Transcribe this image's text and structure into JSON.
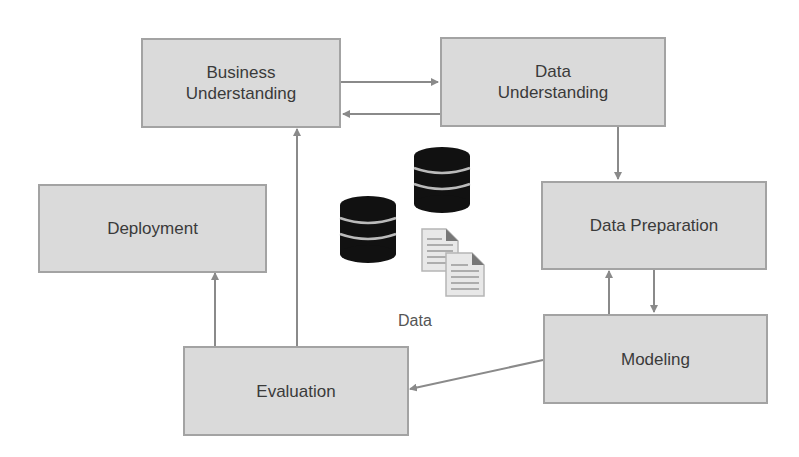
{
  "diagram": {
    "nodes": [
      {
        "id": "business",
        "label_line1": "Business",
        "label_line2": "Understanding"
      },
      {
        "id": "data_understanding",
        "label_line1": "Data",
        "label_line2": "Understanding"
      },
      {
        "id": "data_preparation",
        "label": "Data Preparation"
      },
      {
        "id": "modeling",
        "label": "Modeling"
      },
      {
        "id": "evaluation",
        "label": "Evaluation"
      },
      {
        "id": "deployment",
        "label": "Deployment"
      }
    ],
    "center": {
      "label": "Data",
      "icons": [
        "database-icon",
        "database-icon",
        "document-icon",
        "document-icon"
      ]
    },
    "edges": [
      {
        "from": "business",
        "to": "data_understanding"
      },
      {
        "from": "data_understanding",
        "to": "business"
      },
      {
        "from": "data_understanding",
        "to": "data_preparation"
      },
      {
        "from": "data_preparation",
        "to": "modeling"
      },
      {
        "from": "modeling",
        "to": "data_preparation"
      },
      {
        "from": "modeling",
        "to": "evaluation"
      },
      {
        "from": "evaluation",
        "to": "business"
      },
      {
        "from": "evaluation",
        "to": "deployment"
      }
    ],
    "colors": {
      "box_fill": "#dadada",
      "box_border": "#a3a3a3",
      "arrow": "#8a8a8a",
      "text": "#3a3a3a",
      "icon": "#111111"
    }
  }
}
